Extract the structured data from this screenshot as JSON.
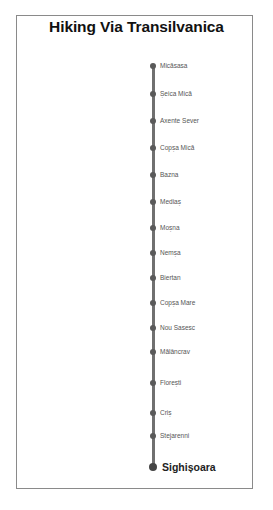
{
  "title": "Hiking Via Transilvanica",
  "colors": {
    "route_line": "#707070",
    "stop_dot": "#5a5a5a",
    "border": "#8a8a8a"
  },
  "stops": [
    {
      "name": "Micăsasa",
      "y": 66
    },
    {
      "name": "Șeica Mică",
      "y": 94
    },
    {
      "name": "Axente Sever",
      "y": 121
    },
    {
      "name": "Copșa Mică",
      "y": 148
    },
    {
      "name": "Bazna",
      "y": 175
    },
    {
      "name": "Mediaș",
      "y": 202
    },
    {
      "name": "Moșna",
      "y": 228
    },
    {
      "name": "Nemșa",
      "y": 253
    },
    {
      "name": "Biertan",
      "y": 278
    },
    {
      "name": "Copșa Mare",
      "y": 303
    },
    {
      "name": "Nou Sasesc",
      "y": 328
    },
    {
      "name": "Mălâncrav",
      "y": 352
    },
    {
      "name": "Florești",
      "y": 383
    },
    {
      "name": "Criș",
      "y": 413
    },
    {
      "name": "Stejarenni",
      "y": 436
    },
    {
      "name": "Sighișoara",
      "y": 467,
      "final": true
    }
  ]
}
